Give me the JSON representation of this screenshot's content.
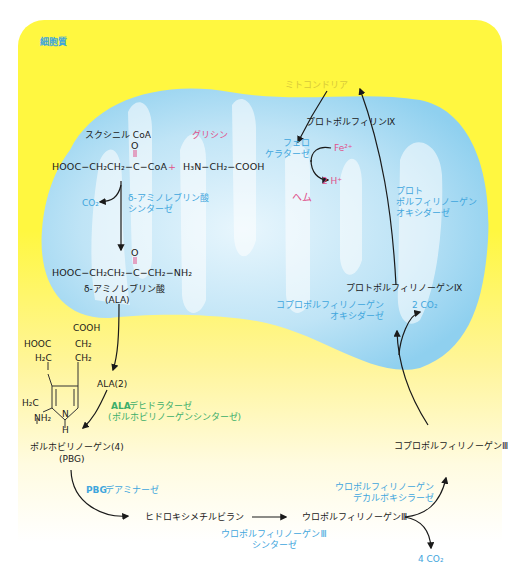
{
  "compartments": {
    "cytoplasm_label": "細胞質",
    "mitochondria_label": "ミトコンドリア"
  },
  "colors": {
    "cytoplasm": "#fff740",
    "mitochondria": "#8fd0ef",
    "enzyme_text": "#3fa6dd",
    "reactant_pink": "#e0508a",
    "enzyme_green": "#3cae6a",
    "arrow": "#1a1a1a"
  },
  "molecules": {
    "succinyl_coa": "スクシニル CoA",
    "glycine": "グリシン",
    "succinyl_formula_left": "HOOC−CH₂CH₂−C−CoA",
    "plus": "+",
    "glycine_formula": "H₃N−CH₂−COOH",
    "carbonyl_o": "O",
    "ala_formula": "HOOC−CH₂CH₂−C−CH₂−NH₂",
    "ala_name": "δ-アミノレブリン酸",
    "ala_abbr": "(ALA)",
    "ala2": "ALA(2)",
    "pbg_name": "ポルホビリノーゲン(4)",
    "pbg_abbr": "(PBG)",
    "hydroxymethylbilane": "ヒドロキシメチルビラン",
    "uroporphyrinogen3": "ウロポルフィリノーゲンⅢ",
    "coproporphyrinogen3": "コプロポルフィリノーゲンⅢ",
    "protoporphyrinogen9": "プロトポルフィリノーゲンⅨ",
    "protoporphyrin9": "プロトポルフィリンⅨ",
    "heme": "ヘム",
    "fe": "Fe²⁺",
    "h2": "2 H⁺",
    "co2": "CO₂",
    "co2_2": "2 CO₂",
    "co2_4": "4 CO₂"
  },
  "pbg_structure": {
    "cooh": "COOH",
    "hooc": "HOOC",
    "ch2_a": "CH₂",
    "ch2_b": "CH₂",
    "h2c_a": "H₂C",
    "h2c_b": "H₂C",
    "nh2": "NH₂",
    "n": "N",
    "h": "H"
  },
  "enzymes": {
    "ala_synthase": [
      "δ-アミノレブリン酸",
      "シンターゼ"
    ],
    "ala_dehydratase_bold": "ALA",
    "ala_dehydratase_rest": " デヒドラターゼ",
    "ala_dehydratase_alt": "(ポルホビリノーゲンシンターゼ)",
    "pbg_deaminase_bold": "PBG",
    "pbg_deaminase_rest": " デアミナーゼ",
    "uro3_synthase": [
      "ウロポルフィリノーゲンⅢ",
      "シンターゼ"
    ],
    "uro_decarboxylase": [
      "ウロポルフィリノーゲン",
      "デカルボキシラーゼ"
    ],
    "copro_oxidase": [
      "コプロポルフィリノーゲン",
      "オキシダーゼ"
    ],
    "proto_oxidase": [
      "プロト",
      "ポルフィリノーゲン",
      "オキシダーゼ"
    ],
    "ferrochelatase": [
      "フェロ",
      "ケラターゼ"
    ]
  }
}
